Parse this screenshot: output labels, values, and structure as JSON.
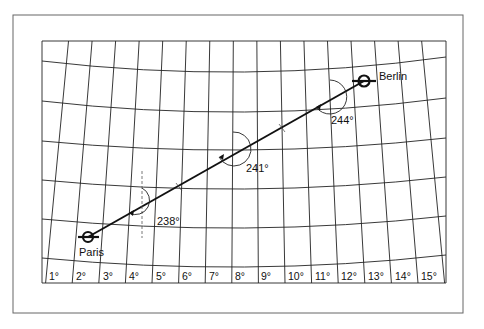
{
  "diagram": {
    "type": "great-circle-route-map",
    "cities": [
      {
        "name": "Paris",
        "x": 88,
        "y": 237,
        "label_x": 78,
        "label_y": 256
      },
      {
        "name": "Berlin",
        "x": 364,
        "y": 81,
        "label_x": 378,
        "label_y": 79
      }
    ],
    "bearing_annotations": [
      {
        "label": "238°",
        "cx": 142,
        "cy": 207,
        "label_x": 157,
        "label_y": 225
      },
      {
        "label": "241°",
        "cx": 233,
        "cy": 149,
        "label_x": 246,
        "label_y": 172
      },
      {
        "label": "244°",
        "cx": 330,
        "cy": 98,
        "label_x": 330,
        "label_y": 124
      }
    ],
    "longitude_labels": [
      "1°",
      "2°",
      "3°",
      "4°",
      "5°",
      "6°",
      "7°",
      "8°",
      "9°",
      "10°",
      "11°",
      "12°",
      "13°",
      "14°",
      "15°"
    ],
    "colors": {
      "line": "#111111",
      "frame": "#555555",
      "background": "#ffffff"
    }
  }
}
